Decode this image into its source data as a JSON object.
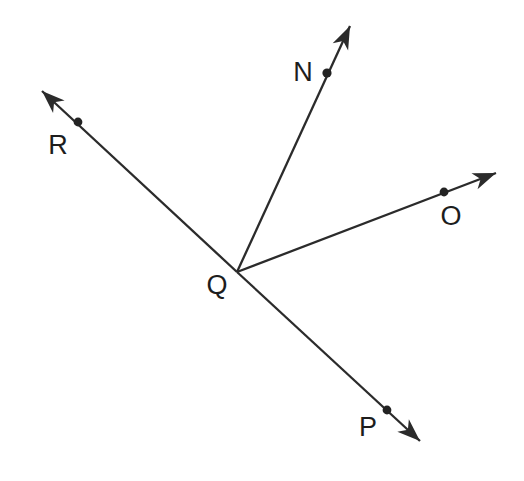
{
  "figure": {
    "type": "geometry-diagram",
    "background_color": "#ffffff",
    "stroke_color": "#2b2b2b",
    "label_color": "#1d1d1d",
    "width": 524,
    "height": 481
  },
  "vertex": {
    "label": "Q",
    "x": 237,
    "y": 272,
    "label_x": 217,
    "label_y": 285
  },
  "rays": [
    {
      "id": "ray-qn",
      "label": "N",
      "label_x": 303,
      "label_y": 72,
      "dot_x": 327,
      "dot_y": 73,
      "tip_x": 350,
      "tip_y": 26,
      "from_x": 237,
      "from_y": 272
    },
    {
      "id": "ray-qo",
      "label": "O",
      "label_x": 451,
      "label_y": 216,
      "dot_x": 444,
      "dot_y": 192,
      "tip_x": 496,
      "tip_y": 173,
      "from_x": 237,
      "from_y": 272
    },
    {
      "id": "ray-qr",
      "label": "R",
      "label_x": 58,
      "label_y": 145,
      "dot_x": 78,
      "dot_y": 122,
      "tip_x": 42,
      "tip_y": 91,
      "from_x": 237,
      "from_y": 272
    },
    {
      "id": "ray-qp",
      "label": "P",
      "label_x": 368,
      "label_y": 427,
      "dot_x": 387,
      "dot_y": 410,
      "tip_x": 420,
      "tip_y": 441,
      "from_x": 237,
      "from_y": 272
    }
  ]
}
